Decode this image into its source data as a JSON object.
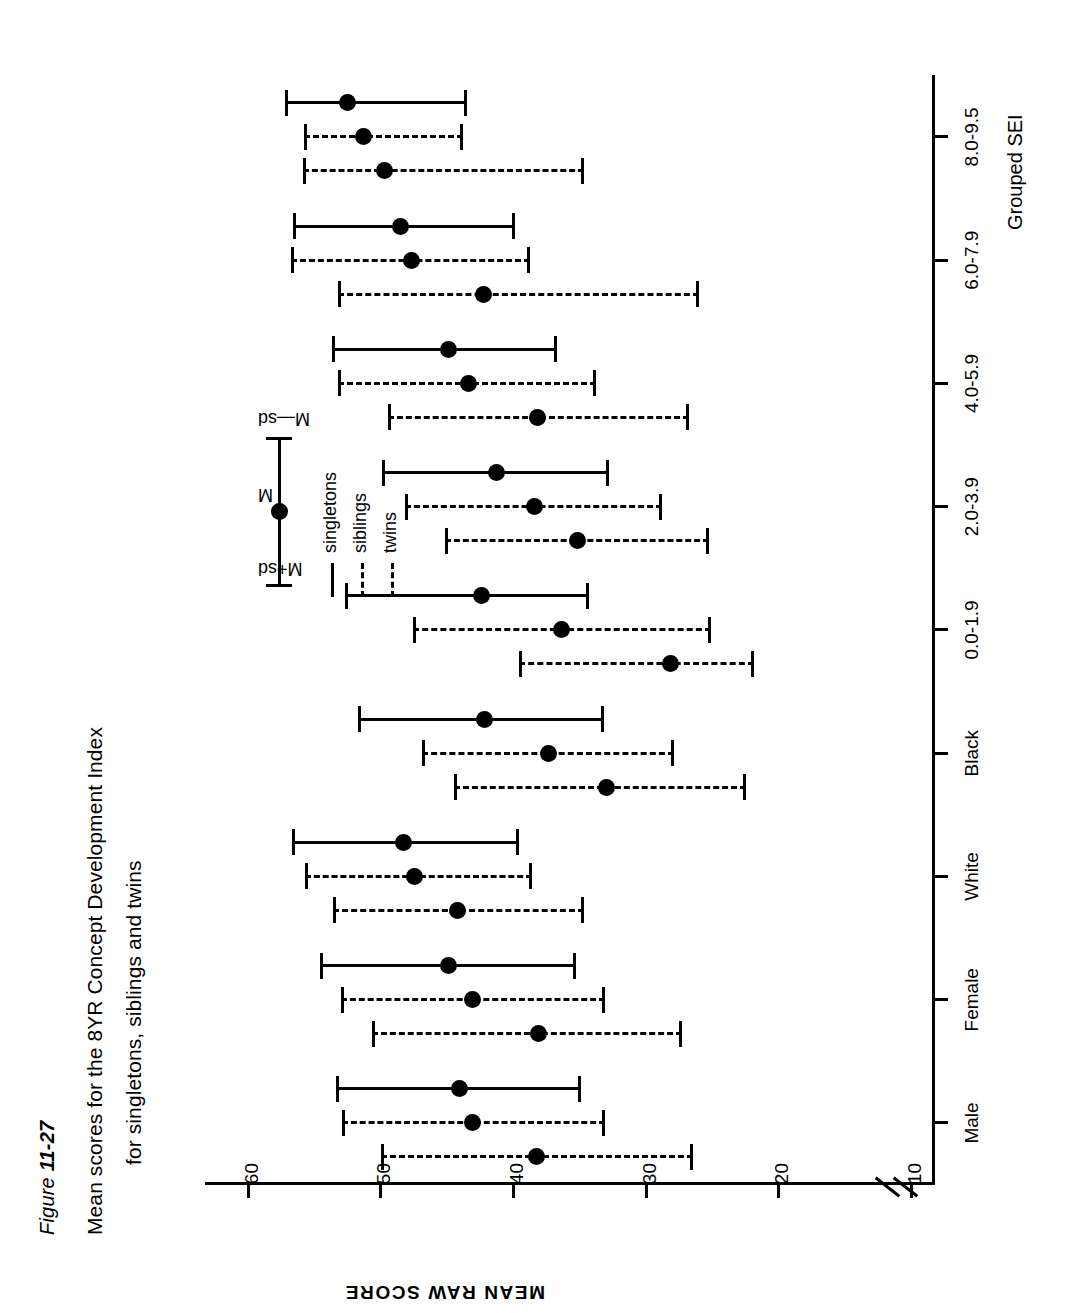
{
  "figure": {
    "number_prefix": "Figure ",
    "number": "11-27",
    "title_line1": "Mean scores for the 8YR Concept Development Index",
    "title_line2": "for singletons, siblings and twins"
  },
  "legend": {
    "upper_tag": "M+sd",
    "mid_tag": "M",
    "lower_tag": "M—sd",
    "series": [
      {
        "label": "singletons",
        "style": "solid"
      },
      {
        "label": "siblings",
        "style": "dashed"
      },
      {
        "label": "twins",
        "style": "dotted"
      }
    ]
  },
  "chart_data": {
    "type": "line",
    "plot_kind": "mean-with-sd-error-bars",
    "title": "Mean scores for the 8YR Concept Development Index for singletons, siblings and twins",
    "xlabel": "Grouped SEI",
    "ylabel": "MEAN RAW SCORE",
    "ylim": [
      10,
      62
    ],
    "yticks": [
      10,
      20,
      30,
      40,
      50,
      60
    ],
    "ytick_labels": [
      "10",
      "20",
      "30",
      "40",
      "50",
      "60"
    ],
    "y_axis_break_below": 15,
    "grid": false,
    "legend_position": "center-right",
    "categories": [
      "Male",
      "Female",
      "White",
      "Black",
      "0.0-1.9",
      "2.0-3.9",
      "4.0-5.9",
      "6.0-7.9",
      "8.0-9.5"
    ],
    "category_groups": [
      "Sex",
      "Sex",
      "Race",
      "Race",
      "Grouped SEI",
      "Grouped SEI",
      "Grouped SEI",
      "Grouped SEI",
      "Grouped SEI"
    ],
    "series": [
      {
        "name": "singletons",
        "style": "solid",
        "mean": [
          44.2,
          45.0,
          48.4,
          42.3,
          42.5,
          41.4,
          45.0,
          48.6,
          52.6
        ],
        "low": [
          35.0,
          35.4,
          39.7,
          33.3,
          34.4,
          32.9,
          36.8,
          40.0,
          43.6
        ],
        "high": [
          53.5,
          54.7,
          56.8,
          51.8,
          52.8,
          50.0,
          53.8,
          56.7,
          57.3
        ]
      },
      {
        "name": "siblings",
        "style": "dashed",
        "mean": [
          43.2,
          43.2,
          47.6,
          37.5,
          36.5,
          38.5,
          43.5,
          47.8,
          51.4
        ],
        "low": [
          33.2,
          33.2,
          38.7,
          28.0,
          25.2,
          28.9,
          33.9,
          38.9,
          43.9
        ],
        "high": [
          53.0,
          53.1,
          55.8,
          47.0,
          47.7,
          48.3,
          53.3,
          56.9,
          55.9
        ]
      },
      {
        "name": "twins",
        "style": "dotted",
        "mean": [
          38.4,
          38.2,
          44.3,
          33.1,
          28.3,
          35.3,
          38.3,
          42.4,
          49.8
        ],
        "low": [
          26.6,
          27.4,
          34.8,
          22.6,
          22.0,
          25.4,
          26.9,
          26.1,
          34.8
        ],
        "high": [
          50.1,
          50.8,
          53.7,
          44.6,
          39.7,
          45.3,
          49.6,
          53.3,
          56.0
        ]
      }
    ]
  }
}
